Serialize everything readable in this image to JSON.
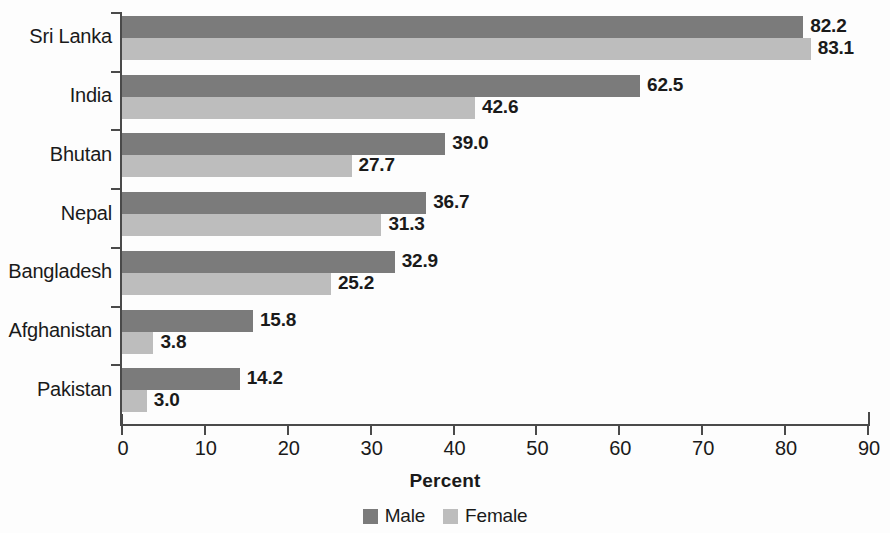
{
  "chart_data": {
    "type": "bar",
    "orientation": "horizontal",
    "title": "",
    "xlabel": "Percent",
    "ylabel": "",
    "xlim": [
      0,
      90
    ],
    "xticks": [
      0,
      10,
      20,
      30,
      40,
      50,
      60,
      70,
      80,
      90
    ],
    "grid": false,
    "legend_position": "bottom",
    "categories": [
      "Sri Lanka",
      "India",
      "Bhutan",
      "Nepal",
      "Bangladesh",
      "Afghanistan",
      "Pakistan"
    ],
    "series": [
      {
        "name": "Male",
        "color": "#7b7b7b",
        "values": [
          82.2,
          62.5,
          39.0,
          36.7,
          32.9,
          15.8,
          14.2
        ],
        "labels": [
          "82.2",
          "62.5",
          "39.0",
          "36.7",
          "32.9",
          "15.8",
          "14.2"
        ]
      },
      {
        "name": "Female",
        "color": "#bdbdbd",
        "values": [
          83.1,
          42.6,
          27.7,
          31.3,
          25.2,
          3.8,
          3.0
        ],
        "labels": [
          "83.1",
          "42.6",
          "27.7",
          "31.3",
          "25.2",
          "3.8",
          "3.0"
        ]
      }
    ]
  },
  "axis": {
    "x_tick_labels": [
      "0",
      "10",
      "20",
      "30",
      "40",
      "50",
      "60",
      "70",
      "80",
      "90"
    ],
    "x_title": "Percent"
  },
  "legend": {
    "items": [
      {
        "label": "Male",
        "color": "#7b7b7b"
      },
      {
        "label": "Female",
        "color": "#bdbdbd"
      }
    ]
  }
}
